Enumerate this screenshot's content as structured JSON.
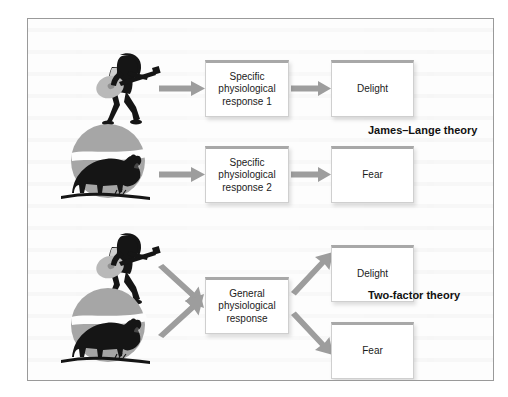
{
  "figure": {
    "border_color": "#9a9a9a",
    "background_color": "#fdfdfd"
  },
  "style": {
    "box_fill": "#ffffff",
    "box_border": "#cfcfcf",
    "box_top_accent": "#a8a8a8",
    "arrow_color": "#9d9d9d",
    "text_color": "#1b1b1b",
    "silhouette_color": "#151515",
    "circle_color": "#a6a6a6",
    "guitar_color": "#b9b9b9"
  },
  "sections": [
    {
      "id": "james-lange",
      "caption": "James–Lange theory",
      "rows": [
        {
          "stimulus": "guitarist-icon",
          "response_box": "Specific\nphysiological\nresponse 1",
          "emotion_box": "Delight"
        },
        {
          "stimulus": "bear-icon",
          "response_box": "Specific\nphysiological\nresponse 2",
          "emotion_box": "Fear"
        }
      ]
    },
    {
      "id": "two-factor",
      "caption": "Two-factor theory",
      "shared_response_box": "General\nphysiological\nresponse",
      "stimuli": [
        "guitarist-icon",
        "bear-icon"
      ],
      "emotion_boxes": [
        "Delight",
        "Fear"
      ]
    }
  ],
  "nodes": {
    "jl_response_1": "Specific\nphysiological\nresponse 1",
    "jl_emotion_1": "Delight",
    "jl_response_2": "Specific\nphysiological\nresponse 2",
    "jl_emotion_2": "Fear",
    "tf_response": "General\nphysiological\nresponse",
    "tf_emotion_1": "Delight",
    "tf_emotion_2": "Fear"
  },
  "captions": {
    "james_lange": "James–Lange theory",
    "two_factor": "Two-factor theory"
  }
}
